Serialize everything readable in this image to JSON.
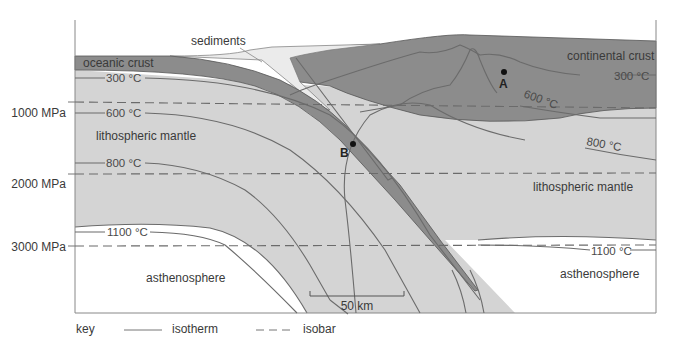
{
  "diagram": {
    "pressure_axis": [
      "1000 MPa",
      "2000 MPa",
      "3000 MPa"
    ],
    "regions": {
      "oceanic_crust": "oceanic crust",
      "sediments": "sediments",
      "continental_crust": "continental crust",
      "lithospheric_mantle_left": "lithospheric mantle",
      "lithospheric_mantle_right": "lithospheric mantle",
      "asthenosphere_left": "asthenosphere",
      "asthenosphere_right": "asthenosphere"
    },
    "isotherms_left": [
      "300 °C",
      "600 °C",
      "800 °C",
      "1100 °C"
    ],
    "isotherms_right": [
      "300 °C",
      "600 °C",
      "800 °C",
      "1100 °C"
    ],
    "points": {
      "a": "A",
      "b": "B"
    },
    "scale_bar": "50 km",
    "colors": {
      "crust_dark": "#8c8c8c",
      "mantle_light": "#d4d4d4",
      "sediment": "#ebebeb",
      "asthenosphere": "#ffffff",
      "line": "#6b6b6b"
    }
  },
  "key": {
    "title": "key",
    "isotherm": "isotherm",
    "isobar": "isobar"
  }
}
